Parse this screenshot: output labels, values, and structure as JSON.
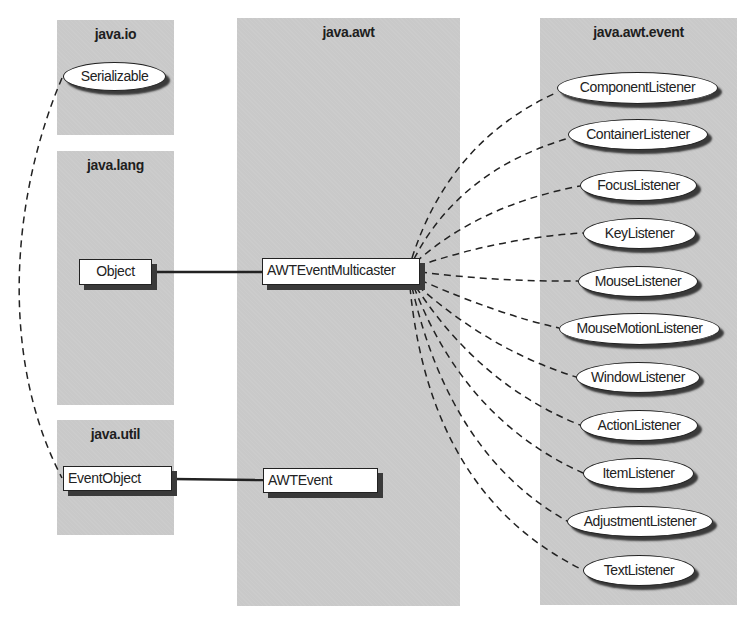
{
  "packages": {
    "java_io": {
      "title": "java.io"
    },
    "java_lang": {
      "title": "java.lang"
    },
    "java_util": {
      "title": "java.util"
    },
    "java_awt": {
      "title": "java.awt"
    },
    "java_awt_event": {
      "title": "java.awt.event"
    }
  },
  "classes": {
    "serializable": "Serializable",
    "object": "Object",
    "event_object": "EventObject",
    "awt_event_multicaster": "AWTEventMulticaster",
    "awt_event": "AWTEvent"
  },
  "listeners": [
    "ComponentListener",
    "ContainerListener",
    "FocusListener",
    "KeyListener",
    "MouseListener",
    "MouseMotionListener",
    "WindowListener",
    "ActionListener",
    "ItemListener",
    "AdjustmentListener",
    "TextListener"
  ],
  "colors": {
    "panel": "#c9c9c9",
    "line": "#222222",
    "shadow": "#3a3a3a"
  }
}
